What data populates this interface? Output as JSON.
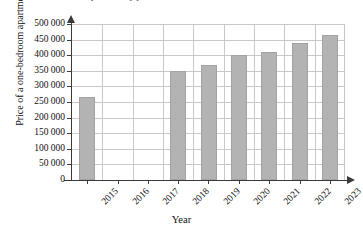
{
  "figure": {
    "top_clipped_text": "Price of a one-bedroom apartment by year",
    "background_color": "#ffffff",
    "bar_color": "#b3b3b3",
    "grid_color": "#c9c9c9",
    "axis_color": "#3a3a3a"
  },
  "chart_data": {
    "type": "bar",
    "title": "",
    "xlabel": "Year",
    "ylabel": "Price of a one-bedroom apartment",
    "categories": [
      "2015",
      "2016",
      "2017",
      "2018",
      "2019",
      "2020",
      "2021",
      "2022",
      "2023"
    ],
    "values": [
      265000,
      null,
      null,
      350000,
      370000,
      400000,
      410000,
      440000,
      465000
    ],
    "ylim": [
      0,
      500000
    ],
    "ytick_labels": [
      "0",
      "50 000",
      "100 000",
      "150 000",
      "200 000",
      "250 000",
      "300 000",
      "350 000",
      "400 000",
      "450 000",
      "500 000"
    ],
    "ytick_values": [
      0,
      50000,
      100000,
      150000,
      200000,
      250000,
      300000,
      350000,
      400000,
      450000,
      500000
    ],
    "grid": true,
    "legend": null
  }
}
